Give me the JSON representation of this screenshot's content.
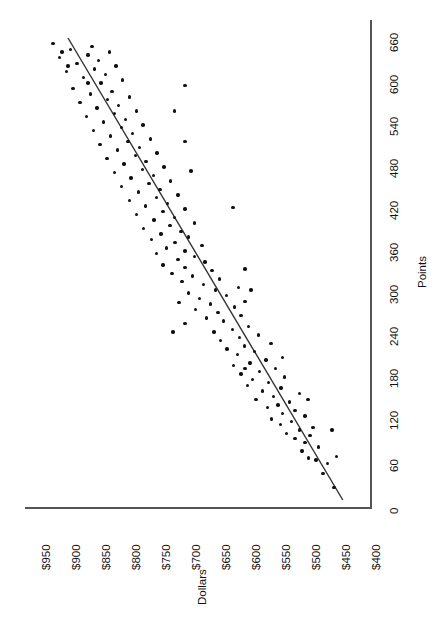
{
  "chart_data": {
    "type": "scatter",
    "title": "",
    "xlabel": "Points",
    "ylabel": "Dollars",
    "orientation": "rotated-90",
    "grid": false,
    "legend": null,
    "xlim": [
      0,
      660
    ],
    "ylim": [
      400,
      950
    ],
    "xticks": [
      0,
      60,
      120,
      180,
      240,
      300,
      360,
      420,
      480,
      540,
      600,
      660
    ],
    "xtick_labels": [
      "0",
      "60",
      "120",
      "180",
      "240",
      "300",
      "360",
      "420",
      "480",
      "540",
      "600",
      "660"
    ],
    "yticks": [
      400,
      450,
      500,
      550,
      600,
      650,
      700,
      750,
      800,
      850,
      900,
      950
    ],
    "ytick_labels": [
      "$400",
      "$450",
      "$500",
      "$550",
      "$600",
      "$650",
      "$700",
      "$750",
      "$800",
      "$850",
      "$900",
      "$950"
    ],
    "trend_line": {
      "type": "linear-fit",
      "x_start": 0,
      "y_start": 437,
      "x_end": 660,
      "y_end": 895,
      "color": "#333333"
    },
    "series": [
      {
        "name": "observations",
        "marker": "filled-circle",
        "color": "#111111",
        "points": [
          [
            18,
            452
          ],
          [
            38,
            470
          ],
          [
            52,
            463
          ],
          [
            57,
            482
          ],
          [
            60,
            494
          ],
          [
            70,
            505
          ],
          [
            76,
            478
          ],
          [
            82,
            500
          ],
          [
            88,
            517
          ],
          [
            92,
            492
          ],
          [
            95,
            531
          ],
          [
            100,
            509
          ],
          [
            104,
            487
          ],
          [
            108,
            541
          ],
          [
            112,
            523
          ],
          [
            116,
            556
          ],
          [
            120,
            500
          ],
          [
            124,
            538
          ],
          [
            128,
            517
          ],
          [
            132,
            563
          ],
          [
            136,
            545
          ],
          [
            140,
            526
          ],
          [
            144,
            582
          ],
          [
            148,
            553
          ],
          [
            152,
            509
          ],
          [
            156,
            571
          ],
          [
            160,
            540
          ],
          [
            164,
            596
          ],
          [
            168,
            561
          ],
          [
            172,
            588
          ],
          [
            176,
            534
          ],
          [
            180,
            607
          ],
          [
            184,
            576
          ],
          [
            188,
            549
          ],
          [
            192,
            619
          ],
          [
            196,
            592
          ],
          [
            200,
            565
          ],
          [
            204,
            538
          ],
          [
            208,
            613
          ],
          [
            212,
            584
          ],
          [
            216,
            630
          ],
          [
            220,
            601
          ],
          [
            224,
            557
          ],
          [
            228,
            641
          ],
          [
            232,
            609
          ],
          [
            236,
            578
          ],
          [
            240,
            652
          ],
          [
            244,
            621
          ],
          [
            248,
            594
          ],
          [
            252,
            700
          ],
          [
            256,
            636
          ],
          [
            260,
            664
          ],
          [
            264,
            607
          ],
          [
            268,
            645
          ],
          [
            272,
            683
          ],
          [
            276,
            618
          ],
          [
            280,
            658
          ],
          [
            284,
            600
          ],
          [
            288,
            676
          ],
          [
            292,
            631
          ],
          [
            296,
            694
          ],
          [
            300,
            649
          ],
          [
            304,
            611
          ],
          [
            308,
            669
          ],
          [
            312,
            705
          ],
          [
            316,
            643
          ],
          [
            320,
            688
          ],
          [
            324,
            722
          ],
          [
            328,
            655
          ],
          [
            332,
            700
          ],
          [
            336,
            737
          ],
          [
            340,
            667
          ],
          [
            344,
            712
          ],
          [
            348,
            684
          ],
          [
            352,
            748
          ],
          [
            356,
            700
          ],
          [
            360,
            731
          ],
          [
            364,
            672
          ],
          [
            368,
            717
          ],
          [
            372,
            756
          ],
          [
            376,
            694
          ],
          [
            380,
            740
          ],
          [
            384,
            707
          ],
          [
            388,
            769
          ],
          [
            392,
            725
          ],
          [
            396,
            684
          ],
          [
            400,
            752
          ],
          [
            404,
            718
          ],
          [
            408,
            781
          ],
          [
            412,
            737
          ],
          [
            416,
            700
          ],
          [
            420,
            766
          ],
          [
            424,
            729
          ],
          [
            428,
            793
          ],
          [
            432,
            748
          ],
          [
            436,
            712
          ],
          [
            440,
            778
          ],
          [
            444,
            742
          ],
          [
            448,
            806
          ],
          [
            452,
            760
          ],
          [
            456,
            724
          ],
          [
            460,
            790
          ],
          [
            464,
            753
          ],
          [
            468,
            818
          ],
          [
            472,
            771
          ],
          [
            476,
            735
          ],
          [
            480,
            802
          ],
          [
            484,
            765
          ],
          [
            488,
            830
          ],
          [
            492,
            783
          ],
          [
            496,
            747
          ],
          [
            500,
            813
          ],
          [
            504,
            776
          ],
          [
            508,
            842
          ],
          [
            512,
            795
          ],
          [
            516,
            758
          ],
          [
            520,
            824
          ],
          [
            524,
            788
          ],
          [
            528,
            853
          ],
          [
            532,
            806
          ],
          [
            536,
            770
          ],
          [
            540,
            836
          ],
          [
            544,
            799
          ],
          [
            548,
            864
          ],
          [
            552,
            818
          ],
          [
            556,
            781
          ],
          [
            560,
            847
          ],
          [
            564,
            811
          ],
          [
            568,
            875
          ],
          [
            572,
            829
          ],
          [
            576,
            793
          ],
          [
            580,
            858
          ],
          [
            584,
            822
          ],
          [
            588,
            887
          ],
          [
            592,
            700
          ],
          [
            596,
            840
          ],
          [
            600,
            804
          ],
          [
            604,
            869
          ],
          [
            608,
            833
          ],
          [
            612,
            898
          ],
          [
            616,
            851
          ],
          [
            620,
            815
          ],
          [
            624,
            880
          ],
          [
            628,
            844
          ],
          [
            632,
            909
          ],
          [
            636,
            862
          ],
          [
            640,
            826
          ],
          [
            644,
            891
          ],
          [
            648,
            855
          ],
          [
            652,
            920
          ],
          [
            240,
            720
          ],
          [
            282,
            710
          ],
          [
            300,
            590
          ],
          [
            330,
            600
          ],
          [
            418,
            620
          ],
          [
            470,
            690
          ],
          [
            512,
            700
          ],
          [
            556,
            718
          ],
          [
            188,
            600
          ],
          [
            144,
            495
          ],
          [
            100,
            455
          ],
          [
            62,
            448
          ],
          [
            596,
            862
          ],
          [
            620,
            895
          ],
          [
            640,
            905
          ]
        ]
      }
    ]
  },
  "axes": {
    "dollars": {
      "title": "Dollars",
      "tick_labels": [
        "$950",
        "$900",
        "$850",
        "$800",
        "$750",
        "$700",
        "$650",
        "$600",
        "$550",
        "$500",
        "$450",
        "$400"
      ]
    },
    "points": {
      "title": "Points",
      "tick_labels": [
        "660",
        "600",
        "540",
        "480",
        "420",
        "360",
        "300",
        "240",
        "180",
        "120",
        "60",
        "0"
      ]
    }
  }
}
